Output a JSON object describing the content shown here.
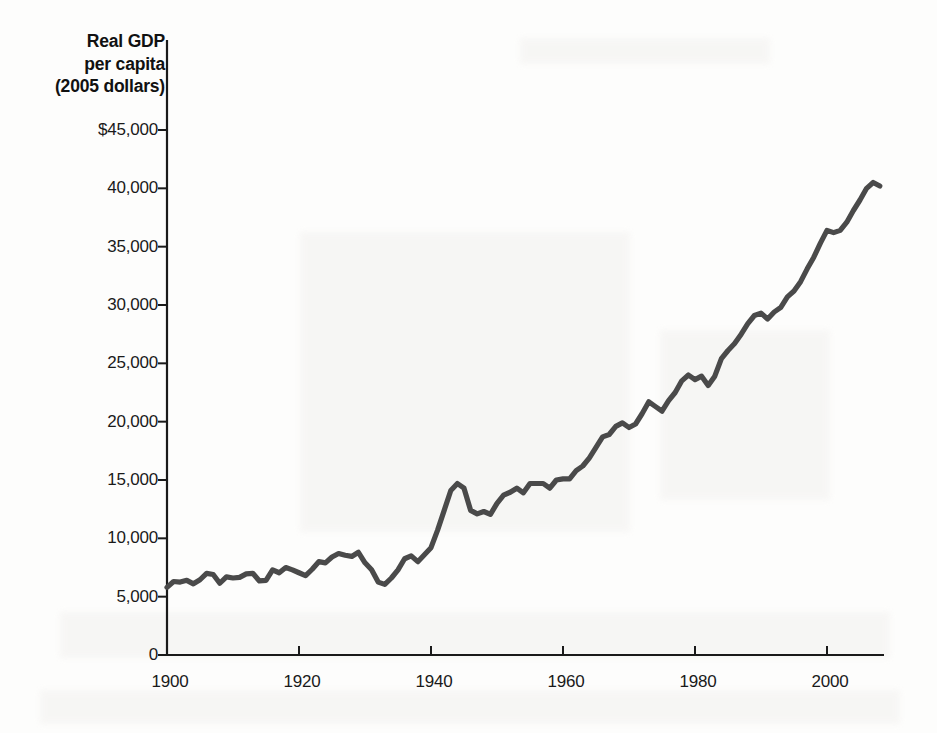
{
  "chart_data": {
    "type": "line",
    "title": "Real GDP per capita (2005 dollars)",
    "ylabel": "Real GDP\nper capita\n(2005 dollars)",
    "xlabel": "",
    "xlim": [
      1900,
      2008
    ],
    "ylim": [
      0,
      45000
    ],
    "grid": false,
    "legend": null,
    "line_color": "#4a4a4a",
    "axis_color": "#1a1a1a",
    "background_color": "#fdfdfc",
    "y_ticks": [
      0,
      5000,
      10000,
      15000,
      20000,
      25000,
      30000,
      35000,
      40000,
      45000
    ],
    "y_tick_labels": [
      "0",
      "5,000",
      "10,000",
      "15,000",
      "20,000",
      "25,000",
      "30,000",
      "35,000",
      "40,000",
      "$45,000"
    ],
    "x_ticks": [
      1900,
      1920,
      1940,
      1960,
      1980,
      2000
    ],
    "x_tick_labels": [
      "1900",
      "1920",
      "1940",
      "1960",
      "1980",
      "2000"
    ],
    "series": [
      {
        "name": "Real GDP per capita",
        "x": [
          1900,
          1901,
          1902,
          1903,
          1904,
          1905,
          1906,
          1907,
          1908,
          1909,
          1910,
          1911,
          1912,
          1913,
          1914,
          1915,
          1916,
          1917,
          1918,
          1919,
          1920,
          1921,
          1922,
          1923,
          1924,
          1925,
          1926,
          1927,
          1928,
          1929,
          1930,
          1931,
          1932,
          1933,
          1934,
          1935,
          1936,
          1937,
          1938,
          1939,
          1940,
          1941,
          1942,
          1943,
          1944,
          1945,
          1946,
          1947,
          1948,
          1949,
          1950,
          1951,
          1952,
          1953,
          1954,
          1955,
          1956,
          1957,
          1958,
          1959,
          1960,
          1961,
          1962,
          1963,
          1964,
          1965,
          1966,
          1967,
          1968,
          1969,
          1970,
          1971,
          1972,
          1973,
          1974,
          1975,
          1976,
          1977,
          1978,
          1979,
          1980,
          1981,
          1982,
          1983,
          1984,
          1985,
          1986,
          1987,
          1988,
          1989,
          1990,
          1991,
          1992,
          1993,
          1994,
          1995,
          1996,
          1997,
          1998,
          1999,
          2000,
          2001,
          2002,
          2003,
          2004,
          2005,
          2006,
          2007,
          2008
        ],
        "values": [
          5800,
          6300,
          6250,
          6400,
          6100,
          6450,
          7000,
          6900,
          6150,
          6700,
          6600,
          6650,
          6950,
          7000,
          6350,
          6400,
          7300,
          7050,
          7500,
          7300,
          7050,
          6800,
          7350,
          8000,
          7900,
          8400,
          8700,
          8550,
          8450,
          8800,
          7900,
          7300,
          6250,
          6050,
          6600,
          7300,
          8250,
          8500,
          8000,
          8600,
          9200,
          10700,
          12400,
          14100,
          14700,
          14300,
          12400,
          12100,
          12300,
          12050,
          13000,
          13700,
          13950,
          14300,
          13900,
          14700,
          14700,
          14700,
          14300,
          15000,
          15100,
          15100,
          15800,
          16200,
          16900,
          17800,
          18700,
          18900,
          19600,
          19900,
          19500,
          19800,
          20700,
          21700,
          21300,
          20900,
          21800,
          22500,
          23500,
          24000,
          23600,
          23900,
          23100,
          23900,
          25400,
          26100,
          26700,
          27500,
          28400,
          29100,
          29300,
          28800,
          29400,
          29800,
          30700,
          31200,
          32000,
          33100,
          34100,
          35300,
          36400,
          36200,
          36400,
          37100,
          38100,
          39000,
          40000,
          40500,
          40200
        ]
      }
    ]
  },
  "axes": {
    "y_axis_title_lines": [
      "Real GDP",
      "per capita",
      "(2005 dollars)"
    ]
  }
}
